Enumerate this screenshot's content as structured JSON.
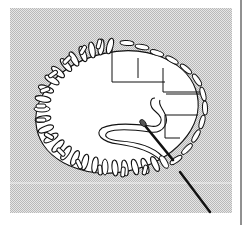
{
  "figure": {
    "title": "",
    "colors": {
      "background": "#ffffff",
      "hatch_light": "#e6e6e6",
      "hatch_dark": "#b9b9b9",
      "ink": "#111111",
      "fill": "#ffffff"
    },
    "elements": [
      {
        "name": "hatched-fabric-panel"
      },
      {
        "name": "oval-opening"
      },
      {
        "name": "finished-stitches-left"
      },
      {
        "name": "open-stitches-right"
      },
      {
        "name": "guide-grid-lines"
      },
      {
        "name": "loose-thread-loop"
      },
      {
        "name": "needle-upper"
      },
      {
        "name": "needle-lower"
      }
    ]
  }
}
